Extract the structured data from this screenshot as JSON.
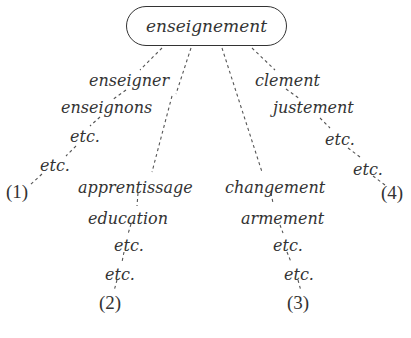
{
  "diagram": {
    "type": "associative-relations-tree",
    "root": {
      "label": "enseignement"
    },
    "branches": [
      {
        "id": 1,
        "marker": "(1)",
        "items": [
          "enseigner",
          "enseignons",
          "etc.",
          "etc."
        ]
      },
      {
        "id": 2,
        "marker": "(2)",
        "items": [
          "apprentissage",
          "education",
          "etc.",
          "etc."
        ]
      },
      {
        "id": 3,
        "marker": "(3)",
        "items": [
          "changement",
          "armement",
          "etc.",
          "etc."
        ]
      },
      {
        "id": 4,
        "marker": "(4)",
        "items": [
          "clement",
          "justement",
          "etc.",
          "etc."
        ]
      }
    ],
    "colors": {
      "text": "#333333",
      "lines": "#555555",
      "background": "#ffffff"
    },
    "line_style": "dashed"
  }
}
